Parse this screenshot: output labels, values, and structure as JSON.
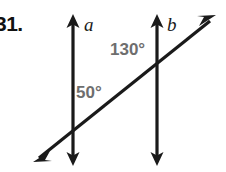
{
  "figure": {
    "problem_number": "31.",
    "background_color": "#ffffff",
    "stroke_color": "#1a1a1a",
    "label_color": "#6e6e6e",
    "line_label_color": "#1a1a1a",
    "width": 226,
    "height": 172
  },
  "lines": {
    "a": {
      "label": "a",
      "type": "vertical-double-arrow",
      "x": 73,
      "y_top": 15,
      "y_bottom": 165
    },
    "b": {
      "label": "b",
      "type": "vertical-double-arrow",
      "x": 157,
      "y_top": 15,
      "y_bottom": 165
    },
    "transversal": {
      "label": "",
      "type": "diagonal-double-arrow",
      "x_start": 33,
      "y_start": 162,
      "x_end": 216,
      "y_end": 15
    }
  },
  "intersections": {
    "a_transversal": {
      "x": 73,
      "y": 130
    },
    "b_transversal": {
      "x": 157,
      "y": 63
    }
  },
  "angles": [
    {
      "name": "angle-50",
      "text": "50°",
      "value": 50,
      "unit": "degrees",
      "at_line": "a",
      "x": 76,
      "y": 84
    },
    {
      "name": "angle-130",
      "text": "130°",
      "value": 130,
      "unit": "degrees",
      "at_line": "b",
      "x": 110,
      "y": 41
    }
  ]
}
